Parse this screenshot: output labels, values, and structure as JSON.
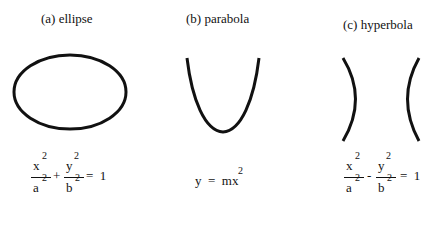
{
  "captions": {
    "a": "(a)  ellipse",
    "b": "(b)  parabola",
    "c": "(c)  hyperbola"
  },
  "equations": {
    "ellipse": {
      "term1_num": "x",
      "term1_num_exp": "2",
      "term1_den": "a",
      "term1_den_exp": "2",
      "operator": "+",
      "term2_num": "y",
      "term2_num_exp": "2",
      "term2_den": "b",
      "term2_den_exp": "2",
      "rhs": "=  1"
    },
    "parabola": {
      "lhs": "y  =  mx",
      "exp": "2"
    },
    "hyperbola": {
      "term1_num": "x",
      "term1_num_exp": "2",
      "term1_den": "a",
      "term1_den_exp": "2",
      "operator": "-",
      "term2_num": "y",
      "term2_num_exp": "2",
      "term2_den": "b",
      "term2_den_exp": "2",
      "rhs": "=  1"
    }
  },
  "colors": {
    "stroke": "#111111",
    "background": "#ffffff"
  }
}
